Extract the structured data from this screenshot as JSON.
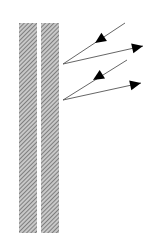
{
  "diagram": {
    "colors": {
      "background": "#ffffff",
      "hatch_fg": "#6b6b6b",
      "hatch_bg": "#c8c8c8",
      "ray": "#555555",
      "arrowhead": "#000000"
    },
    "slabs": [
      {
        "id": "slab-left",
        "x": 19,
        "y": 23,
        "width": 18,
        "height": 210
      },
      {
        "id": "slab-right",
        "x": 41,
        "y": 23,
        "width": 18,
        "height": 210
      }
    ],
    "rays": [
      {
        "id": "incident-1",
        "type": "incident",
        "from": [
          125,
          23
        ],
        "to": [
          63,
          64
        ],
        "arrow_at": [
          95,
          43
        ]
      },
      {
        "id": "reflected-1",
        "type": "reflected",
        "from": [
          63,
          64
        ],
        "to": [
          143,
          46
        ],
        "arrow_at": [
          143,
          46
        ]
      },
      {
        "id": "incident-2",
        "type": "incident",
        "from": [
          127,
          60
        ],
        "to": [
          63,
          100
        ],
        "arrow_at": [
          93,
          80
        ]
      },
      {
        "id": "reflected-2",
        "type": "reflected",
        "from": [
          63,
          100
        ],
        "to": [
          141,
          83
        ],
        "arrow_at": [
          141,
          83
        ]
      }
    ]
  }
}
